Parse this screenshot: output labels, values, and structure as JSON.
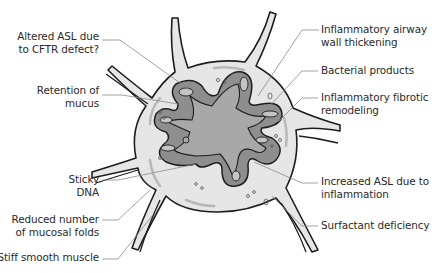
{
  "diagram": {
    "colors": {
      "background": "#ffffff",
      "tissue_fill": "#e6e6e6",
      "outline": "#1e1e1e",
      "wall_fill": "#8e8e8e",
      "lumen_fill": "#a8a8a8",
      "inner_lining": "#c4c4c4",
      "leader_line": "#8a8a8a",
      "text": "#2a2a2a"
    },
    "labels_left": [
      {
        "id": "altered-asl",
        "lines": [
          "Altered ASL due",
          "to CFTR defect?"
        ]
      },
      {
        "id": "retention-mucus",
        "lines": [
          "Retention of",
          "mucus"
        ]
      },
      {
        "id": "sticky-dna",
        "lines": [
          "Sticky",
          "DNA"
        ]
      },
      {
        "id": "reduced-folds",
        "lines": [
          "Reduced number",
          "of mucosal folds"
        ]
      },
      {
        "id": "stiff-muscle",
        "lines": [
          "Stiff smooth muscle"
        ]
      }
    ],
    "labels_right": [
      {
        "id": "inflam-thickening",
        "lines": [
          "Inflammatory airway",
          "wall thickening"
        ]
      },
      {
        "id": "bacterial-products",
        "lines": [
          "Bacterial products"
        ]
      },
      {
        "id": "fibrotic-remodeling",
        "lines": [
          "Inflammatory fibrotic",
          "remodeling"
        ]
      },
      {
        "id": "increased-asl",
        "lines": [
          "Increased ASL due to",
          "inflammation"
        ]
      },
      {
        "id": "surfactant-deficiency",
        "lines": [
          "Surfactant deficiency"
        ]
      }
    ]
  }
}
